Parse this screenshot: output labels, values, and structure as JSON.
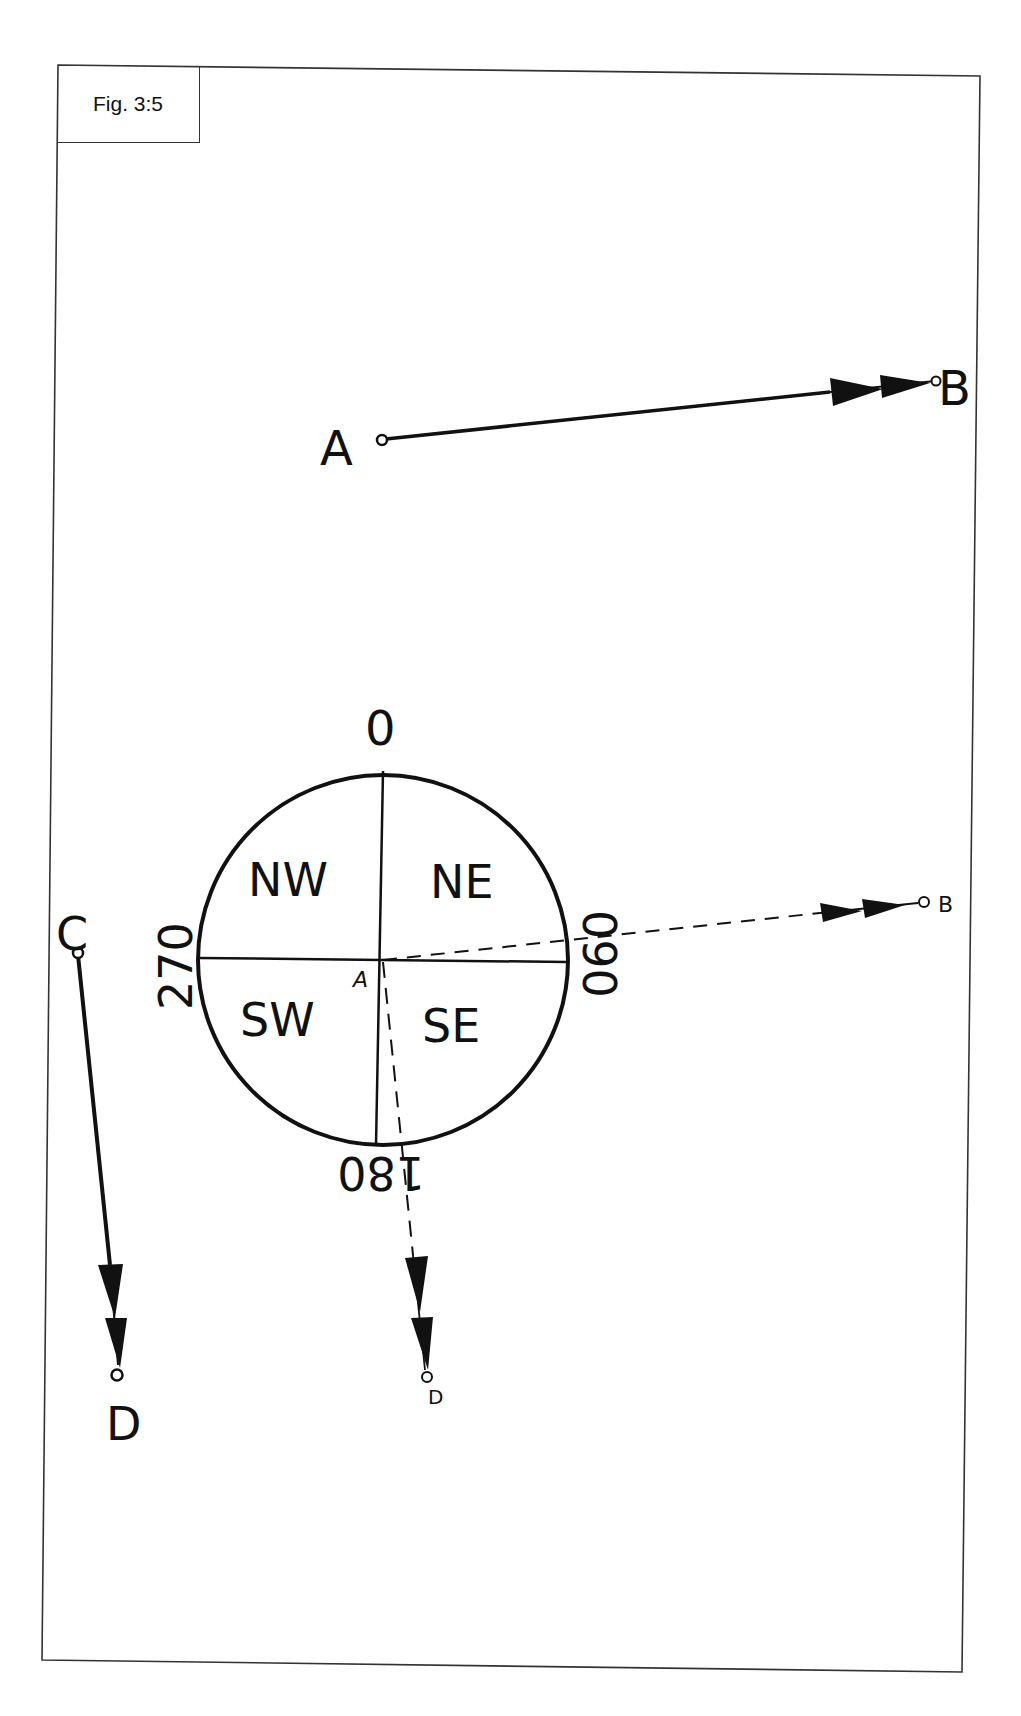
{
  "figure": {
    "caption": "Fig. 3:5"
  },
  "labels": {
    "point_a_top": "A",
    "point_b_top": "B",
    "point_c": "C",
    "point_d_left": "D",
    "compass_center": "A",
    "dashed_b": "B",
    "dashed_d": "D"
  },
  "compass": {
    "bearing_north": "0",
    "bearing_east": "090",
    "bearing_south": "180",
    "bearing_west": "270",
    "quadrant_nw": "NW",
    "quadrant_ne": "NE",
    "quadrant_sw": "SW",
    "quadrant_se": "SE"
  },
  "colors": {
    "ink": "#111111",
    "frame": "#333333",
    "paper": "#ffffff"
  }
}
